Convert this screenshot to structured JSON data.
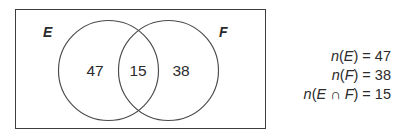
{
  "diagram": {
    "type": "venn-two-set",
    "universe_box": {
      "shape": "rectangle"
    },
    "sets": [
      {
        "id": "E",
        "label": "E",
        "count": 47
      },
      {
        "id": "F",
        "label": "F",
        "count": 38
      }
    ],
    "regions": [
      {
        "id": "E-only",
        "label": "47"
      },
      {
        "id": "E-and-F",
        "label": "15"
      },
      {
        "id": "F-only",
        "label": "38"
      }
    ],
    "labels": {
      "set_e": "E",
      "set_f": "F"
    },
    "counts": {
      "left_only": "47",
      "intersection": "15",
      "right_only": "38"
    },
    "colors": {
      "ink": "#2b2b2b",
      "box_stroke": "#3d3d3d",
      "circle_stroke": "#4a4a4a",
      "background": "#ffffff"
    }
  },
  "equations": [
    {
      "id": "n-of-e",
      "fn": "n",
      "open": "(",
      "arg": "E",
      "close": ")",
      "eq": "=",
      "value": "47",
      "text": "n(E) = 47"
    },
    {
      "id": "n-of-f",
      "fn": "n",
      "open": "(",
      "arg": "F",
      "close": ")",
      "eq": "=",
      "value": "38",
      "text": "n(F) = 38"
    },
    {
      "id": "n-of-e-or-f",
      "fn": "n",
      "open": "(",
      "arg": "E ∩ F",
      "close": ")",
      "eq": "=",
      "value": "15",
      "text": "n(E ∩ F) = 15"
    }
  ],
  "equation_lines": {
    "line1": {
      "fn": "n",
      "lparen": "(",
      "arg": "E",
      "rparen": ")",
      "equals": " = ",
      "value": "47"
    },
    "line2": {
      "fn": "n",
      "lparen": "(",
      "arg": "F",
      "rparen": ")",
      "equals": " = ",
      "value": "38"
    },
    "line3": {
      "fn": "n",
      "lparen": "(",
      "arg1": "E",
      "cap": " ∩ ",
      "arg2": "F",
      "rparen": ")",
      "equals": " = ",
      "value": "15"
    }
  }
}
